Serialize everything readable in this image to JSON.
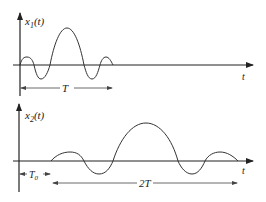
{
  "plots": [
    {
      "name": "x1",
      "ylabel": "x",
      "ylabel_sub": "1",
      "ylabel_arg": "(t)",
      "xlabel": "t",
      "span_label": "T"
    },
    {
      "name": "x2",
      "ylabel": "x",
      "ylabel_sub": "2",
      "ylabel_arg": "(t)",
      "xlabel": "t",
      "offset_label": "T",
      "offset_sub": "0",
      "span_label": "2T"
    }
  ],
  "colors": {
    "line": "#333333",
    "background": "#ffffff"
  }
}
